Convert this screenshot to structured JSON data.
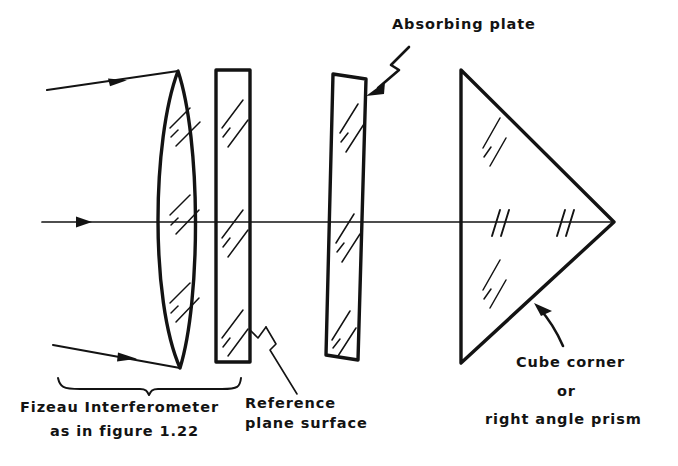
{
  "figure": {
    "title_visible": false,
    "background_color": "#ffffff",
    "ink_color": "#131313"
  },
  "labels": {
    "absorbing_plate": "Absorbing plate",
    "reference_plane_line1": "Reference",
    "reference_plane_line2": "plane surface",
    "fizeau_line1": "Fizeau Interferometer",
    "fizeau_line2": "as in figure 1.22",
    "prism_line1": "Cube corner",
    "prism_line2": "or",
    "prism_line3": "right angle prism"
  },
  "components": [
    {
      "name": "collimating-lens",
      "kind": "lens",
      "shape": "biconvex, strongly curved left face, near-flat right face",
      "top_vertex": [
        178,
        71
      ],
      "bottom_vertex": [
        180,
        368
      ],
      "hatch_groups": 3
    },
    {
      "name": "reference-flat",
      "kind": "plate",
      "shape": "upright rectangular glass plate",
      "x_left": 216,
      "x_right": 250,
      "y_top": 70,
      "y_bottom": 362,
      "tilt_degrees": 0,
      "hatch_groups": 3
    },
    {
      "name": "absorbing-plate",
      "kind": "plate",
      "shape": "tilted rectangular glass plate",
      "x_left": 333,
      "x_right": 366,
      "y_top": 74,
      "y_bottom": 360,
      "tilt_degrees": 5,
      "hatch_groups": 3
    },
    {
      "name": "cube-corner-prism",
      "kind": "prism",
      "shape": "right angle triangle apex pointing right",
      "vertex_top": [
        461,
        70
      ],
      "vertex_bottom": [
        461,
        363
      ],
      "vertex_apex": [
        614,
        222
      ],
      "hatch_groups": 2
    }
  ],
  "rays": [
    {
      "name": "upper-input-ray",
      "from": [
        47,
        90
      ],
      "to": [
        178,
        71
      ],
      "arrow_at": [
        118,
        80
      ]
    },
    {
      "name": "axis-ray",
      "from": [
        42,
        222
      ],
      "to": [
        614,
        222
      ],
      "arrow_at": [
        85,
        222
      ]
    },
    {
      "name": "lower-input-ray",
      "from": [
        53,
        345
      ],
      "to": [
        180,
        368
      ],
      "arrow_at": [
        127,
        358
      ]
    }
  ],
  "leaders": [
    {
      "name": "absorbing-plate-leader",
      "style": "zigzag-with-arrowhead",
      "points_to": [
        365,
        93
      ]
    },
    {
      "name": "reference-plate-leader",
      "style": "zigzag-line",
      "points_to": [
        243,
        340
      ]
    },
    {
      "name": "prism-leader",
      "style": "curved-arrow",
      "points_to": [
        536,
        306
      ]
    },
    {
      "name": "fizeau-brace",
      "style": "curly-brace",
      "span_x": [
        58,
        240
      ],
      "y": 385
    }
  ],
  "colors": {
    "ink": "#131313",
    "paper": "#ffffff"
  }
}
